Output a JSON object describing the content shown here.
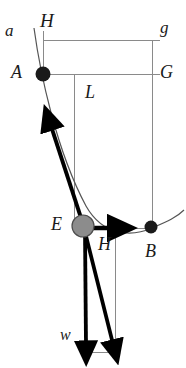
{
  "figure": {
    "background_color": "#ffffff",
    "line_color": "#8a8a8a",
    "curve_color": "#555555",
    "vector_color": "#000000",
    "ball_fill": "#8c8c8c",
    "ball_stroke": "#4d4d4d",
    "node_fill": "#1a1a1a",
    "width": 186,
    "height": 368
  },
  "labels": {
    "a": "a",
    "H_top": "H",
    "g": "g",
    "A": "A",
    "G": "G",
    "L": "L",
    "E": "E",
    "H_bottom": "H",
    "B": "B",
    "w": "w"
  },
  "points": {
    "A": {
      "x": 43,
      "y": 74,
      "kind": "filled-node"
    },
    "B": {
      "x": 151,
      "y": 227,
      "kind": "filled-node"
    },
    "E": {
      "x": 83,
      "y": 226,
      "kind": "ball"
    }
  },
  "vectors": [
    {
      "name": "tension-vector",
      "from": "E",
      "to_x": 49,
      "to_y": 122,
      "label": ""
    },
    {
      "name": "horizontal-H-vector",
      "from": "E",
      "to_x": 117,
      "to_y": 228,
      "label": "H"
    },
    {
      "name": "weight-vector-w",
      "from": "E",
      "to_x": 86,
      "to_y": 350,
      "label": "w"
    },
    {
      "name": "resultant-vector",
      "from": "E",
      "to_x": 114,
      "to_y": 350,
      "label": ""
    }
  ],
  "guides": [
    {
      "name": "top-horizontal-a-g",
      "x1": 43,
      "y1": 40,
      "x2": 160,
      "y2": 40
    },
    {
      "name": "mid-horizontal-A-G",
      "x1": 43,
      "y1": 74,
      "x2": 160,
      "y2": 74
    },
    {
      "name": "left-vertical-H",
      "x1": 43,
      "y1": 30,
      "x2": 43,
      "y2": 74
    },
    {
      "name": "center-vertical-L",
      "x1": 74,
      "y1": 74,
      "x2": 74,
      "y2": 226
    },
    {
      "name": "right-vertical-g-B",
      "x1": 152,
      "y1": 40,
      "x2": 152,
      "y2": 227
    },
    {
      "name": "drop-vertical-H",
      "x1": 115,
      "y1": 228,
      "x2": 115,
      "y2": 352
    },
    {
      "name": "E-to-drop-horizontal",
      "x1": 83,
      "y1": 228,
      "x2": 115,
      "y2": 228
    },
    {
      "name": "B-to-drop-horizontal",
      "x1": 115,
      "y1": 228,
      "x2": 151,
      "y2": 228
    },
    {
      "name": "bottom-horizontal-closure",
      "x1": 86,
      "y1": 352,
      "x2": 115,
      "y2": 352
    }
  ],
  "curve": {
    "name": "pendulum-arc",
    "description": "arc of swing passing through a, A, E, B"
  }
}
